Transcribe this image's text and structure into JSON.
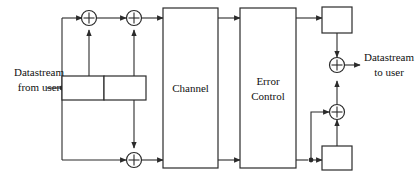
{
  "diagram": {
    "stroke_color": "#2b2b2b",
    "text_color": "#111111",
    "background": "#ffffff",
    "blocks": [
      {
        "id": "shift-register-cell-1",
        "label": ""
      },
      {
        "id": "shift-register-cell-2",
        "label": ""
      },
      {
        "id": "channel",
        "label": "Channel"
      },
      {
        "id": "error-control",
        "label": "Error Control",
        "line1": "Error",
        "line2": "Control"
      },
      {
        "id": "decoder-register-top",
        "label": ""
      },
      {
        "id": "decoder-register-bottom",
        "label": ""
      }
    ],
    "adders": [
      {
        "id": "adder-top-left",
        "symbol": "+"
      },
      {
        "id": "adder-top-right",
        "symbol": "+"
      },
      {
        "id": "adder-bottom",
        "symbol": "+"
      },
      {
        "id": "adder-output-upper",
        "symbol": "+"
      },
      {
        "id": "adder-output-lower",
        "symbol": "+"
      }
    ],
    "labels": {
      "input": "Datastream from user",
      "input_line1": "Datastream",
      "input_line2": "from user",
      "output": "Datastream to user",
      "output_line1": "Datastream",
      "output_line2": "to user",
      "channel": "Channel",
      "error_control_line1": "Error",
      "error_control_line2": "Control"
    }
  }
}
